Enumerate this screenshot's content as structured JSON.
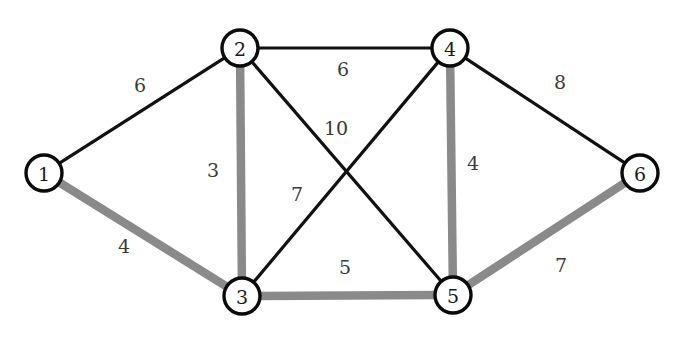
{
  "figure": {
    "caption": "",
    "width": 692,
    "height": 346,
    "background_color": "#ffffff"
  },
  "style": {
    "node_fill": "#ffffff",
    "node_stroke": "#0a0a0a",
    "node_radius": 18,
    "edge_normal_color": "#111111",
    "edge_normal_width": 3.2,
    "edge_highlight_color": "#8a8a8a",
    "edge_highlight_width": 8.5,
    "label_color": "#3a3a3a"
  },
  "chart_data": {
    "type": "diagram",
    "subtype": "weighted-undirected-graph",
    "title": "",
    "nodes": [
      {
        "id": "1",
        "label": "1",
        "x": 44,
        "y": 173
      },
      {
        "id": "2",
        "label": "2",
        "x": 240,
        "y": 48
      },
      {
        "id": "3",
        "label": "3",
        "x": 242,
        "y": 296
      },
      {
        "id": "4",
        "label": "4",
        "x": 450,
        "y": 48
      },
      {
        "id": "5",
        "label": "5",
        "x": 453,
        "y": 295
      },
      {
        "id": "6",
        "label": "6",
        "x": 640,
        "y": 173
      }
    ],
    "edges": [
      {
        "source": "1",
        "target": "2",
        "weight": 6,
        "label": "6",
        "highlighted": false,
        "label_x": 140,
        "label_y": 85
      },
      {
        "source": "1",
        "target": "3",
        "weight": 4,
        "label": "4",
        "highlighted": true,
        "label_x": 124,
        "label_y": 246
      },
      {
        "source": "2",
        "target": "3",
        "weight": 3,
        "label": "3",
        "highlighted": true,
        "label_x": 213,
        "label_y": 170
      },
      {
        "source": "2",
        "target": "4",
        "weight": 6,
        "label": "6",
        "highlighted": false,
        "label_x": 343,
        "label_y": 69
      },
      {
        "source": "2",
        "target": "5",
        "weight": 10,
        "label": "10",
        "highlighted": false,
        "label_x": 336,
        "label_y": 128
      },
      {
        "source": "3",
        "target": "4",
        "weight": 7,
        "label": "7",
        "highlighted": false,
        "label_x": 297,
        "label_y": 194
      },
      {
        "source": "3",
        "target": "5",
        "weight": 5,
        "label": "5",
        "highlighted": true,
        "label_x": 345,
        "label_y": 267
      },
      {
        "source": "4",
        "target": "5",
        "weight": 4,
        "label": "4",
        "highlighted": true,
        "label_x": 473,
        "label_y": 163
      },
      {
        "source": "4",
        "target": "6",
        "weight": 8,
        "label": "8",
        "highlighted": false,
        "label_x": 560,
        "label_y": 82
      },
      {
        "source": "5",
        "target": "6",
        "weight": 7,
        "label": "7",
        "highlighted": true,
        "label_x": 561,
        "label_y": 265
      }
    ],
    "legend": [],
    "annotations": []
  }
}
